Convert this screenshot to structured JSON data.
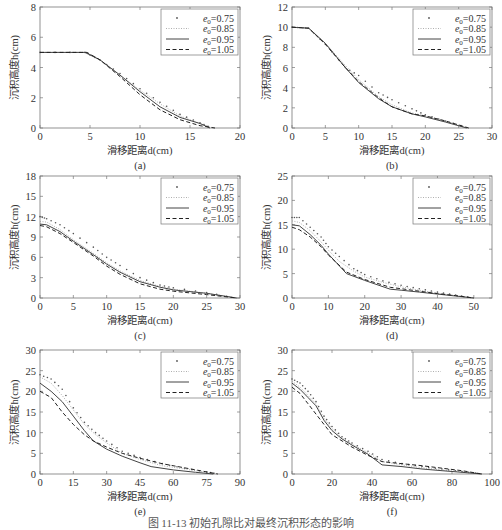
{
  "caption": "图 11-13  初始孔隙比对最终沉积形态的影响",
  "legend": {
    "entries": [
      {
        "label_sym": "e",
        "label_sub": "0",
        "label_val": "=0.75",
        "style": "dots",
        "color": "#555555"
      },
      {
        "label_sym": "e",
        "label_sub": "0",
        "label_val": "=0.85",
        "style": "dotted",
        "color": "#9a9a9a"
      },
      {
        "label_sym": "e",
        "label_sub": "0",
        "label_val": "=0.95",
        "style": "solid",
        "color": "#444444"
      },
      {
        "label_sym": "e",
        "label_sub": "0",
        "label_val": "=1.05",
        "style": "dashed",
        "color": "#222222"
      }
    ]
  },
  "chart_data": [
    {
      "id": "a",
      "type": "line",
      "panel_label": "(a)",
      "xlabel": "滑移距离d(cm)",
      "ylabel": "沉积高度h(cm)",
      "xlim": [
        0,
        20
      ],
      "ylim": [
        0,
        8
      ],
      "xticks": [
        0,
        5,
        10,
        15,
        20
      ],
      "yticks": [
        0,
        2,
        4,
        6,
        8
      ],
      "grid": false,
      "legend_position": "upper right",
      "series": [
        {
          "name": "e0=0.75",
          "x": [
            0,
            4.5,
            6,
            8,
            10,
            12,
            14,
            16,
            17.2
          ],
          "y": [
            5,
            5,
            4.5,
            3.6,
            2.6,
            1.7,
            0.9,
            0.35,
            0
          ]
        },
        {
          "name": "e0=0.85",
          "x": [
            0,
            4.5,
            6,
            8,
            10,
            12,
            14,
            16,
            17.3
          ],
          "y": [
            5,
            5,
            4.5,
            3.5,
            2.5,
            1.6,
            0.8,
            0.3,
            0
          ]
        },
        {
          "name": "e0=0.95",
          "x": [
            0,
            4.5,
            6,
            8,
            10,
            12,
            14,
            16,
            17
          ],
          "y": [
            5,
            5,
            4.5,
            3.5,
            2.4,
            1.4,
            0.7,
            0.3,
            0
          ]
        },
        {
          "name": "e0=1.05",
          "x": [
            0,
            4.7,
            6,
            8,
            10,
            12,
            14,
            16,
            17.5
          ],
          "y": [
            5,
            5,
            4.5,
            3.4,
            2.2,
            1.2,
            0.55,
            0.15,
            0
          ]
        }
      ]
    },
    {
      "id": "b",
      "type": "line",
      "panel_label": "(b)",
      "xlabel": "滑移距离d(cm)",
      "ylabel": "沉积高度h(cm)",
      "xlim": [
        0,
        30
      ],
      "ylim": [
        0,
        12
      ],
      "xticks": [
        0,
        5,
        10,
        15,
        20,
        25,
        30
      ],
      "yticks": [
        0,
        2,
        4,
        6,
        8,
        10,
        12
      ],
      "grid": false,
      "legend_position": "upper right",
      "series": [
        {
          "name": "e0=0.75",
          "x": [
            0,
            2.5,
            5,
            8,
            10,
            13,
            15,
            18,
            20,
            23,
            26.5
          ],
          "y": [
            10,
            9.9,
            8.3,
            6.0,
            5.2,
            3.5,
            2.8,
            1.9,
            1.3,
            0.7,
            0
          ]
        },
        {
          "name": "e0=0.85",
          "x": [
            0,
            2.5,
            5,
            8,
            10,
            13,
            15,
            18,
            20,
            23,
            26.5
          ],
          "y": [
            10,
            9.9,
            8.4,
            6.2,
            4.8,
            3.1,
            2.3,
            1.5,
            1.2,
            0.7,
            0
          ]
        },
        {
          "name": "e0=0.95",
          "x": [
            0,
            2.5,
            5,
            8,
            10,
            13,
            15,
            18,
            20,
            23,
            26.2
          ],
          "y": [
            10,
            9.9,
            8.4,
            6.0,
            4.5,
            2.9,
            2.1,
            1.4,
            1.1,
            0.6,
            0
          ]
        },
        {
          "name": "e0=1.05",
          "x": [
            0,
            2.5,
            5,
            8,
            10,
            13,
            15,
            18,
            20,
            23,
            26.5
          ],
          "y": [
            10,
            9.9,
            8.3,
            6.0,
            4.6,
            3.0,
            2.1,
            1.4,
            1.2,
            0.7,
            0
          ]
        }
      ]
    },
    {
      "id": "c",
      "type": "line",
      "panel_label": "(c)",
      "xlabel": "滑移距离d(cm)",
      "ylabel": "沉积高度h(cm)",
      "xlim": [
        0,
        30
      ],
      "ylim": [
        0,
        18
      ],
      "xticks": [
        0,
        5,
        10,
        15,
        20,
        25,
        30
      ],
      "yticks": [
        0,
        3,
        6,
        9,
        12,
        15,
        18
      ],
      "grid": false,
      "legend_position": "upper right",
      "series": [
        {
          "name": "e0=0.75",
          "x": [
            0,
            1,
            3,
            5,
            8,
            10,
            12,
            15,
            18,
            20,
            25,
            29.5
          ],
          "y": [
            12,
            11.7,
            10.8,
            9.5,
            7.5,
            6.0,
            4.8,
            3.0,
            1.9,
            1.5,
            0.8,
            0
          ]
        },
        {
          "name": "e0=0.85",
          "x": [
            0,
            1,
            3,
            5,
            8,
            10,
            12,
            15,
            18,
            20,
            25,
            29.5
          ],
          "y": [
            11.3,
            11.2,
            10.1,
            8.6,
            6.6,
            5.2,
            4.0,
            2.6,
            1.7,
            1.3,
            0.7,
            0
          ]
        },
        {
          "name": "e0=0.95",
          "x": [
            0,
            1,
            3,
            5,
            8,
            10,
            12,
            15,
            18,
            20,
            25,
            29.5
          ],
          "y": [
            10.9,
            10.8,
            9.8,
            8.4,
            6.4,
            5.0,
            3.8,
            2.4,
            1.6,
            1.2,
            0.7,
            0
          ]
        },
        {
          "name": "e0=1.05",
          "x": [
            0,
            1,
            3,
            5,
            8,
            10,
            12,
            15,
            18,
            20,
            25,
            29.5
          ],
          "y": [
            10.7,
            10.5,
            9.5,
            8.2,
            6.2,
            4.7,
            3.5,
            2.1,
            1.3,
            1.0,
            0.5,
            0
          ]
        }
      ]
    },
    {
      "id": "d",
      "type": "line",
      "panel_label": "(d)",
      "xlabel": "滑移距离d(cm)",
      "ylabel": "沉积高度h(cm)",
      "xlim": [
        0,
        55
      ],
      "ylim": [
        0,
        25
      ],
      "xticks": [
        0,
        10,
        20,
        30,
        40,
        50
      ],
      "yticks": [
        0,
        5,
        10,
        15,
        20,
        25
      ],
      "grid": false,
      "legend_position": "upper right",
      "series": [
        {
          "name": "e0=0.75",
          "x": [
            0,
            2,
            5,
            8,
            10,
            13,
            17,
            20,
            25,
            30,
            35,
            40,
            45,
            50
          ],
          "y": [
            16.5,
            16.5,
            14.5,
            12.5,
            10.5,
            8.5,
            6.0,
            4.8,
            3.5,
            2.6,
            1.9,
            1.2,
            0.6,
            0
          ]
        },
        {
          "name": "e0=0.85",
          "x": [
            0,
            2,
            5,
            8,
            10,
            13,
            17,
            20,
            25,
            30,
            35,
            40,
            45,
            50
          ],
          "y": [
            15.8,
            15.5,
            13.8,
            11.5,
            9.8,
            7.5,
            5.5,
            4.3,
            3.2,
            2.3,
            1.6,
            1.0,
            0.5,
            0
          ]
        },
        {
          "name": "e0=0.95",
          "x": [
            0,
            2,
            5,
            8,
            10,
            15,
            20,
            27,
            30,
            35,
            40,
            45,
            50
          ],
          "y": [
            15,
            14.8,
            13.0,
            10.8,
            9.0,
            5.0,
            3.6,
            1.8,
            1.6,
            1.2,
            0.8,
            0.4,
            0
          ]
        },
        {
          "name": "e0=1.05",
          "x": [
            0,
            2,
            5,
            8,
            10,
            15,
            20,
            27,
            30,
            35,
            40,
            45,
            50
          ],
          "y": [
            14.5,
            14.0,
            12.5,
            10.5,
            8.8,
            5.3,
            3.8,
            2.2,
            1.9,
            1.4,
            0.9,
            0.5,
            0
          ]
        }
      ]
    },
    {
      "id": "e",
      "type": "line",
      "panel_label": "(e)",
      "xlabel": "滑移距离d(cm)",
      "ylabel": "沉积高度h(cm)",
      "xlim": [
        0,
        90
      ],
      "ylim": [
        0,
        30
      ],
      "xticks": [
        0,
        15,
        30,
        45,
        60,
        75,
        90
      ],
      "yticks": [
        0,
        5,
        10,
        15,
        20,
        25,
        30
      ],
      "grid": false,
      "legend_position": "upper right",
      "series": [
        {
          "name": "e0=0.75",
          "x": [
            0,
            5,
            10,
            15,
            20,
            25,
            30,
            37,
            45,
            55,
            65,
            75,
            80
          ],
          "y": [
            24,
            23,
            20.5,
            16,
            12.5,
            10,
            8.0,
            5.5,
            4.0,
            2.5,
            1.4,
            0.5,
            0
          ]
        },
        {
          "name": "e0=0.85",
          "x": [
            0,
            5,
            10,
            15,
            20,
            25,
            30,
            37,
            45,
            55,
            65,
            75,
            80
          ],
          "y": [
            23.5,
            22,
            19.0,
            15.5,
            12.0,
            9.5,
            7.5,
            5.0,
            3.5,
            2.0,
            1.2,
            0.4,
            0
          ]
        },
        {
          "name": "e0=0.95",
          "x": [
            0,
            5,
            10,
            15,
            20,
            24,
            30,
            37,
            45,
            50,
            60,
            70,
            78
          ],
          "y": [
            22,
            20,
            17.5,
            14.0,
            10.5,
            8.0,
            6.0,
            4.3,
            2.7,
            1.8,
            1.0,
            0.4,
            0
          ]
        },
        {
          "name": "e0=1.05",
          "x": [
            0,
            5,
            10,
            15,
            20,
            24,
            30,
            37,
            45,
            55,
            65,
            75,
            80
          ],
          "y": [
            20,
            18.5,
            15.0,
            12.0,
            9.5,
            8.0,
            6.5,
            5.0,
            3.8,
            2.5,
            1.5,
            0.5,
            0
          ]
        }
      ]
    },
    {
      "id": "f",
      "type": "line",
      "panel_label": "(f)",
      "xlabel": "滑移距离d(cm)",
      "ylabel": "沉积高度h(cm)",
      "xlim": [
        0,
        100
      ],
      "ylim": [
        0,
        30
      ],
      "xticks": [
        0,
        20,
        40,
        60,
        80,
        100
      ],
      "yticks": [
        0,
        5,
        10,
        15,
        20,
        25,
        30
      ],
      "grid": false,
      "legend_position": "upper right",
      "series": [
        {
          "name": "e0=0.75",
          "x": [
            0,
            4,
            8,
            12,
            16,
            20,
            25,
            30,
            38,
            45,
            55,
            65,
            75,
            85,
            95
          ],
          "y": [
            23,
            22,
            20,
            17.5,
            14,
            11.5,
            9.0,
            7.5,
            5.5,
            3.5,
            2.5,
            1.8,
            1.2,
            0.6,
            0
          ]
        },
        {
          "name": "e0=0.85",
          "x": [
            0,
            4,
            8,
            12,
            16,
            20,
            25,
            30,
            38,
            45,
            55,
            65,
            75,
            85,
            95
          ],
          "y": [
            22.5,
            21,
            19,
            17,
            13.5,
            11,
            8.7,
            7.2,
            5.2,
            3.0,
            2.2,
            1.5,
            1.0,
            0.5,
            0
          ]
        },
        {
          "name": "e0=0.95",
          "x": [
            0,
            4,
            8,
            12,
            16,
            20,
            25,
            30,
            38,
            45,
            55,
            65,
            75,
            85,
            95
          ],
          "y": [
            22,
            20.5,
            18.5,
            16.5,
            13,
            10.5,
            8.5,
            7.0,
            4.8,
            2.2,
            1.8,
            1.2,
            0.8,
            0.4,
            0
          ]
        },
        {
          "name": "e0=1.05",
          "x": [
            0,
            4,
            8,
            12,
            16,
            20,
            25,
            30,
            38,
            45,
            55,
            65,
            75,
            85,
            95
          ],
          "y": [
            21,
            19.5,
            17.0,
            14.5,
            12,
            9.5,
            8.0,
            6.5,
            4.5,
            3.0,
            2.5,
            2.0,
            1.4,
            0.8,
            0
          ]
        }
      ]
    }
  ]
}
